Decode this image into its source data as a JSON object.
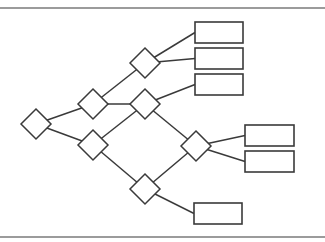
{
  "diagram": {
    "type": "decision-tree",
    "colors": {
      "stroke": "#3a3a3a",
      "rule": "#7a7a7a",
      "background": "#ffffff",
      "fill": "#ffffff"
    },
    "rules": [
      {
        "id": "top-rule",
        "y": 8
      },
      {
        "id": "bottom-rule",
        "y": 237
      }
    ],
    "decision_nodes": [
      {
        "id": "d0",
        "cx": 36,
        "cy": 124,
        "r": 15
      },
      {
        "id": "d1",
        "cx": 93,
        "cy": 104,
        "r": 15
      },
      {
        "id": "d2",
        "cx": 93,
        "cy": 145,
        "r": 15
      },
      {
        "id": "d3",
        "cx": 145,
        "cy": 63,
        "r": 15
      },
      {
        "id": "d4",
        "cx": 145,
        "cy": 104,
        "r": 15
      },
      {
        "id": "d5",
        "cx": 196,
        "cy": 146,
        "r": 15
      },
      {
        "id": "d6",
        "cx": 145,
        "cy": 189,
        "r": 15
      }
    ],
    "leaf_nodes": [
      {
        "id": "l0",
        "x": 195,
        "y": 22,
        "w": 48,
        "h": 21,
        "label": ""
      },
      {
        "id": "l1",
        "x": 195,
        "y": 48,
        "w": 48,
        "h": 21,
        "label": ""
      },
      {
        "id": "l2",
        "x": 195,
        "y": 74,
        "w": 48,
        "h": 21,
        "label": ""
      },
      {
        "id": "l3",
        "x": 245,
        "y": 125,
        "w": 49,
        "h": 21,
        "label": ""
      },
      {
        "id": "l4",
        "x": 245,
        "y": 151,
        "w": 49,
        "h": 21,
        "label": ""
      },
      {
        "id": "l5",
        "x": 194,
        "y": 203,
        "w": 48,
        "h": 21,
        "label": ""
      }
    ],
    "edges": [
      {
        "from": "d0",
        "to": "d1"
      },
      {
        "from": "d0",
        "to": "d2"
      },
      {
        "from": "d1",
        "to": "d3"
      },
      {
        "from": "d1",
        "to": "d4"
      },
      {
        "from": "d2",
        "to": "d4"
      },
      {
        "from": "d2",
        "to": "d6"
      },
      {
        "from": "d3",
        "to": "l0"
      },
      {
        "from": "d3",
        "to": "l1"
      },
      {
        "from": "d4",
        "to": "l2"
      },
      {
        "from": "d4",
        "to": "d5"
      },
      {
        "from": "d6",
        "to": "d5"
      },
      {
        "from": "d5",
        "to": "l3"
      },
      {
        "from": "d5",
        "to": "l4"
      },
      {
        "from": "d6",
        "to": "l5"
      }
    ]
  }
}
